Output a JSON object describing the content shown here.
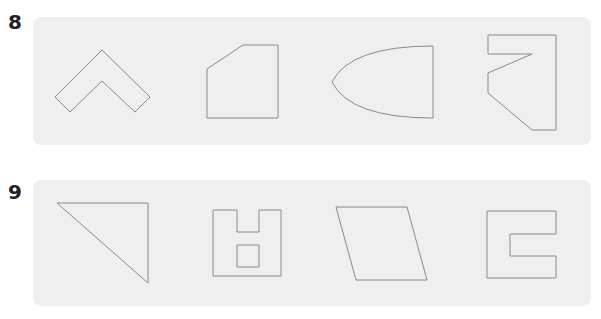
{
  "questions": [
    {
      "number": "8",
      "shapes": [
        {
          "name": "chevron",
          "type": "polygon",
          "points": "55,97 102,50 150,97 135,112 102,81 70,112"
        },
        {
          "name": "cut-corner-square",
          "type": "polygon",
          "points": "207,69 243,45 278,45 278,118 207,118"
        },
        {
          "name": "half-ellipse",
          "type": "path",
          "d": "M433,46 L433,118 Q350,118 332,82 Q350,46 433,46 Z"
        },
        {
          "name": "hook-shape",
          "type": "polygon",
          "points": "488,35 556,35 556,130 532,130 488,93 488,73 532,54 488,54"
        }
      ]
    },
    {
      "number": "9",
      "shapes": [
        {
          "name": "right-triangle",
          "type": "polygon",
          "points": "57,203 148,203 148,283"
        },
        {
          "name": "notched-square-with-hole",
          "type": "path",
          "d": "M213,210 L237,210 L237,232 L259,232 L259,210 L281,210 L281,276 L213,276 Z M237,245 L259,245 L259,267 L237,267 Z"
        },
        {
          "name": "parallelogram",
          "type": "polygon",
          "points": "336,207 407,207 427,280 356,280"
        },
        {
          "name": "c-shape",
          "type": "polygon",
          "points": "487,211 556,211 556,234 510,234 510,256 556,256 556,278 487,278"
        }
      ]
    }
  ],
  "colors": {
    "panel_bg": "#efefef",
    "stroke": "#8a8a8a",
    "number": "#222222"
  }
}
